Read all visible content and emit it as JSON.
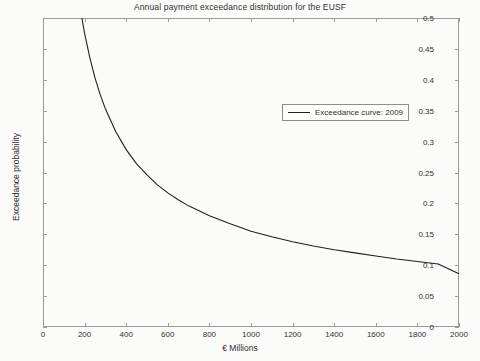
{
  "chart_data": {
    "type": "line",
    "title": "Annual payment exceedance distribution for the EUSF",
    "xlabel": "€ Millions",
    "ylabel": "Exceedance probability",
    "xlim": [
      0,
      2000
    ],
    "ylim": [
      0,
      0.5
    ],
    "grid": false,
    "legend_position": "upper-right-inside",
    "xticks": [
      0,
      200,
      400,
      600,
      800,
      1000,
      1200,
      1400,
      1600,
      1800,
      2000
    ],
    "xtick_labels": [
      "0",
      "200",
      "400",
      "600",
      "800",
      "1000",
      "1200",
      "1400",
      "1600",
      "1800",
      "2000"
    ],
    "yticks": [
      0,
      0.05,
      0.1,
      0.15,
      0.2,
      0.25,
      0.3,
      0.35,
      0.4,
      0.45,
      0.5
    ],
    "ytick_labels": [
      "0",
      "0.05",
      "0.1",
      "0.15",
      "0.2",
      "0.25",
      "0.3",
      "0.35",
      "0.4",
      "0.45",
      "0.5"
    ],
    "series": [
      {
        "name": "Exceedance curve: 2009",
        "color": "#1f1f1f",
        "x": [
          187,
          200,
          225,
          250,
          275,
          300,
          350,
          400,
          450,
          500,
          550,
          600,
          650,
          700,
          800,
          900,
          1000,
          1100,
          1200,
          1300,
          1400,
          1500,
          1600,
          1700,
          1800,
          1900,
          2000
        ],
        "y": [
          0.5,
          0.475,
          0.436,
          0.403,
          0.376,
          0.353,
          0.316,
          0.287,
          0.264,
          0.246,
          0.23,
          0.217,
          0.206,
          0.196,
          0.18,
          0.167,
          0.155,
          0.146,
          0.138,
          0.131,
          0.125,
          0.12,
          0.115,
          0.11,
          0.106,
          0.102,
          0.086
        ]
      }
    ]
  },
  "legend": {
    "entries": [
      {
        "label": "Exceedance curve: 2009",
        "color": "#1f1f1f"
      }
    ]
  }
}
